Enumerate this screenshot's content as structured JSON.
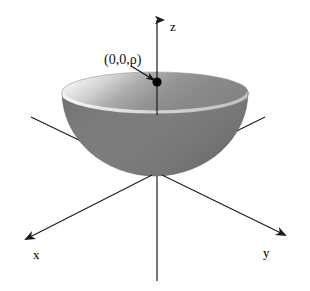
{
  "figure": {
    "background_color": "#ffffff",
    "width": 310,
    "height": 291
  },
  "axes": {
    "z": {
      "label": "z",
      "name": "z-axis",
      "label_x": 170,
      "label_y": 30,
      "line": {
        "x1": 157,
        "y1": 20,
        "x2": 157,
        "y2": 281
      },
      "arrow_at": "top",
      "color": "#1a1a1a"
    },
    "x": {
      "label": "x",
      "name": "x-axis",
      "label_x": 33,
      "label_y": 258,
      "line_back": {
        "x1": 265,
        "y1": 117,
        "x2": 200,
        "y2": 150
      },
      "line_front": {
        "x1": 150,
        "y1": 176,
        "x2": 26,
        "y2": 239
      },
      "arrow_at": "lower-left",
      "color": "#1a1a1a"
    },
    "y": {
      "label": "y",
      "name": "y-axis",
      "label_x": 263,
      "label_y": 256,
      "line_back": {
        "x1": 31,
        "y1": 117,
        "x2": 98,
        "y2": 151
      },
      "line_front": {
        "x1": 163,
        "y1": 176,
        "x2": 285,
        "y2": 235
      },
      "arrow_at": "lower-right",
      "color": "#1a1a1a"
    }
  },
  "surface": {
    "name": "hemisphere-bowl",
    "description": "Upward-opening hemispherical bowl centered at origin",
    "rim_center_x": 155,
    "rim_center_y": 92,
    "rim_rx": 93,
    "rim_ry": 20,
    "bottom_y": 176,
    "outer_color": "#787878",
    "inner_color_light": "#f2f2f2",
    "inner_color_dark": "#8a8a8a",
    "rim_edge_color": "#d8d8d8"
  },
  "annotation": {
    "name": "apex-point-label",
    "text": "(0,0,ρ)",
    "text_x": 104,
    "text_y": 63,
    "leader_line": {
      "x1": 137,
      "y1": 68,
      "x2": 155,
      "y2": 81
    },
    "point": {
      "cx": 157,
      "cy": 82,
      "r": 4.6
    },
    "point_color": "#000000",
    "leader_color": "#111111"
  }
}
